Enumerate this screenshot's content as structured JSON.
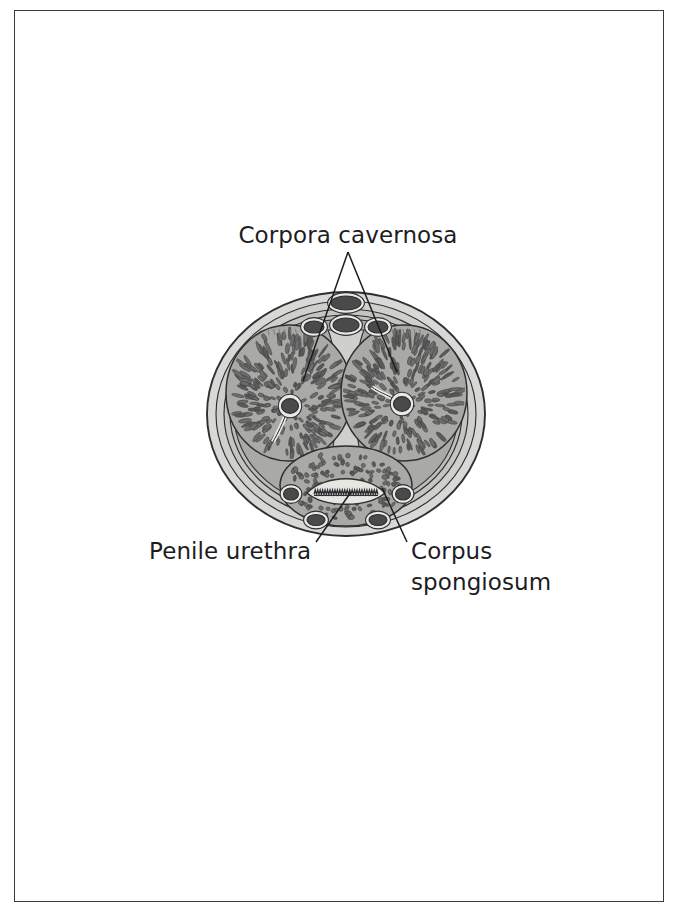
{
  "page": {
    "background_color": "#ffffff",
    "frame_color": "#3a3a3c"
  },
  "palette": {
    "skin_outer": "#d8d8d6",
    "skin_mid": "#c9c9c6",
    "tunica": "#b9b9b5",
    "matrix": "#a9a9a5",
    "trabecula": "#6d6d6d",
    "trabecula_dark": "#5a5a5a",
    "vessel_fill": "#4a4a4a",
    "vessel_ring": "#e8e8e6",
    "outline": "#2f2f31",
    "text": "#1d1d1f",
    "leader": "#1d1d1f"
  },
  "labels": [
    {
      "id": "corpora-cavernosa",
      "text": "Corpora cavernosa",
      "x": 348,
      "y": 243,
      "anchor": "middle",
      "lines": [
        "Corpora cavernosa"
      ]
    },
    {
      "id": "penile-urethra",
      "text": "Penile urethra",
      "x": 149,
      "y": 559,
      "anchor": "start",
      "lines": [
        "Penile urethra"
      ]
    },
    {
      "id": "corpus-spongiosum",
      "text": "Corpus spongiosum",
      "x": 411,
      "y": 559,
      "anchor": "start",
      "lines": [
        "Corpus",
        "spongiosum"
      ]
    }
  ],
  "leaders": [
    {
      "id": "leader-cavernosa-left",
      "points": [
        [
          348,
          252
        ],
        [
          303,
          381
        ]
      ]
    },
    {
      "id": "leader-cavernosa-right",
      "points": [
        [
          348,
          252
        ],
        [
          397,
          372
        ]
      ]
    },
    {
      "id": "leader-urethra",
      "points": [
        [
          316,
          542
        ],
        [
          351,
          492
        ]
      ]
    },
    {
      "id": "leader-spongiosum",
      "points": [
        [
          407,
          542
        ],
        [
          382,
          488
        ]
      ]
    }
  ],
  "anatomy": {
    "center": {
      "x": 346,
      "y": 414
    },
    "outer_rx": 139,
    "outer_ry": 122,
    "rings": [
      {
        "name": "skin",
        "rx": 139,
        "ry": 122,
        "fill": "#d8d8d6"
      },
      {
        "name": "dartos",
        "rx": 130,
        "ry": 113,
        "fill": "#cfcfcc"
      },
      {
        "name": "buck-fascia",
        "rx": 122,
        "ry": 105,
        "fill": "#c4c4c0"
      },
      {
        "name": "tunica-albuginea",
        "rx": 116,
        "ry": 99,
        "fill": "#bdbdb9"
      }
    ],
    "corpora_cavernosa": [
      {
        "side": "left",
        "cx": 289,
        "cy": 393,
        "rx": 63,
        "ry": 68,
        "artery": {
          "cx": 290,
          "cy": 406,
          "r": 8.5
        },
        "label_ref": "corpora-cavernosa"
      },
      {
        "side": "right",
        "cx": 404,
        "cy": 393,
        "rx": 63,
        "ry": 68,
        "artery": {
          "cx": 402,
          "cy": 404,
          "r": 8.5
        },
        "label_ref": "corpora-cavernosa"
      }
    ],
    "corpus_spongiosum": {
      "cx": 346,
      "cy": 486,
      "rx": 66,
      "ry": 40,
      "label_ref": "corpus-spongiosum"
    },
    "urethra": {
      "cx": 346,
      "cy": 493,
      "rx": 39,
      "ry": 10,
      "label_ref": "penile-urethra"
    },
    "dorsal_vessels": [
      {
        "name": "superficial-dorsal-vein",
        "cx": 346,
        "cy": 303,
        "rx": 15,
        "ry": 7
      },
      {
        "name": "deep-dorsal-vein",
        "cx": 346,
        "cy": 325,
        "rx": 13,
        "ry": 7
      },
      {
        "name": "dorsal-artery-left",
        "cx": 314,
        "cy": 327,
        "rx": 10,
        "ry": 6
      },
      {
        "name": "dorsal-artery-right",
        "cx": 378,
        "cy": 327,
        "rx": 10,
        "ry": 6
      }
    ],
    "ventral_vessels": [
      {
        "name": "ventral-vessel-left",
        "cx": 316,
        "cy": 520,
        "rx": 9,
        "ry": 5.5
      },
      {
        "name": "ventral-vessel-right",
        "cx": 378,
        "cy": 520,
        "rx": 9,
        "ry": 5.5
      }
    ],
    "lateral_vessels": [
      {
        "name": "lateral-vessel-left",
        "cx": 291,
        "cy": 494,
        "rx": 7.5,
        "ry": 6
      },
      {
        "name": "lateral-vessel-right",
        "cx": 403,
        "cy": 494,
        "rx": 7.5,
        "ry": 6
      }
    ],
    "septum": {
      "name": "septum-penis",
      "top_y": 330,
      "bottom_y": 462,
      "x": 346,
      "top_width": 18,
      "waist_width": 7
    }
  }
}
